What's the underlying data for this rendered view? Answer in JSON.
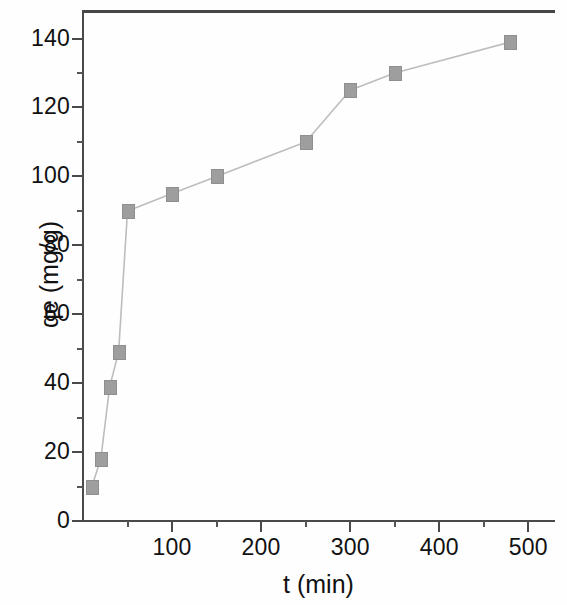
{
  "chart_data": {
    "type": "line",
    "title": "",
    "xlabel": "t (min)",
    "ylabel": "qe (mg/g)",
    "xlim": [
      0,
      530
    ],
    "ylim": [
      0,
      148
    ],
    "xticks": [
      100,
      200,
      300,
      400,
      500
    ],
    "yticks": [
      0,
      20,
      40,
      60,
      80,
      100,
      120,
      140
    ],
    "x_minor_step": 50,
    "y_minor_step": 10,
    "grid": false,
    "legend": null,
    "marker": "square",
    "marker_color": "#9e9e9e",
    "line_color": "#bdbdbd",
    "x": [
      10,
      20,
      30,
      40,
      50,
      100,
      150,
      250,
      300,
      350,
      480
    ],
    "y": [
      10,
      18,
      39,
      49,
      90,
      95,
      100,
      110,
      125,
      130,
      139
    ],
    "series": [
      {
        "name": "qe",
        "points": [
          {
            "x": 10,
            "y": 10
          },
          {
            "x": 20,
            "y": 18
          },
          {
            "x": 30,
            "y": 39
          },
          {
            "x": 40,
            "y": 49
          },
          {
            "x": 50,
            "y": 90
          },
          {
            "x": 100,
            "y": 95
          },
          {
            "x": 150,
            "y": 100
          },
          {
            "x": 250,
            "y": 110
          },
          {
            "x": 300,
            "y": 125
          },
          {
            "x": 350,
            "y": 130
          },
          {
            "x": 480,
            "y": 139
          }
        ]
      }
    ]
  },
  "axes": {
    "x_tick_labels": [
      "100",
      "200",
      "300",
      "400",
      "500"
    ],
    "y_tick_labels": [
      "0",
      "20",
      "40",
      "60",
      "80",
      "100",
      "120",
      "140"
    ],
    "x_title": "t (min)",
    "y_title": "qe (mg/g)"
  }
}
